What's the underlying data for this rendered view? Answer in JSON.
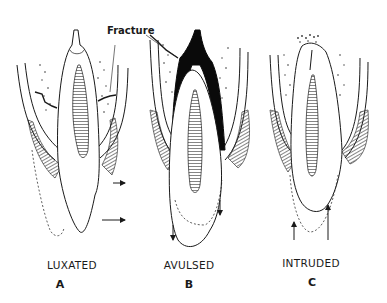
{
  "figure": {
    "annotation": "Fracture",
    "panels": [
      {
        "id": "A",
        "caption": "LUXATED",
        "letter": "A"
      },
      {
        "id": "B",
        "caption": "AVULSED",
        "letter": "B"
      },
      {
        "id": "C",
        "caption": "INTRUDED",
        "letter": "C"
      }
    ],
    "colors": {
      "line": "#1a1a1a",
      "background": "#ffffff",
      "fill_dark": "#0a0a0a"
    }
  }
}
